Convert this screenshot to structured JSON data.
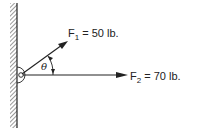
{
  "diagram": {
    "forces": [
      {
        "symbol": "F",
        "subscript": "1",
        "value": "= 50 lb."
      },
      {
        "symbol": "F",
        "subscript": "2",
        "value": "= 70 lb."
      }
    ],
    "angle_label": "θ",
    "colors": {
      "ink": "#222222",
      "background": "#ffffff"
    }
  }
}
